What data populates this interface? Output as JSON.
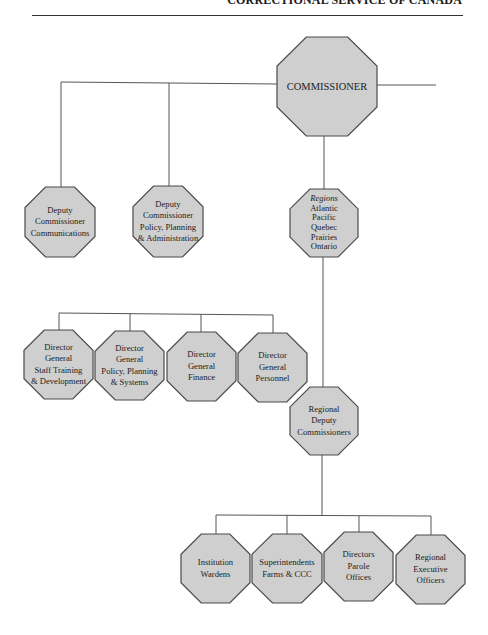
{
  "header": {
    "title": "CORRECTIONAL SERVICE OF CANADA"
  },
  "style": {
    "node_fill": "#cfcfcf",
    "node_stroke": "#4a4a4a",
    "line_color": "#555555"
  },
  "chart": {
    "commissioner": {
      "lines": [
        "COMMISSIONER"
      ]
    },
    "deputies": [
      {
        "lines": [
          "Deputy",
          "Commissioner",
          "Communications"
        ]
      },
      {
        "lines": [
          "Deputy",
          "Commissioner",
          "Policy, Planning",
          "& Administration"
        ]
      }
    ],
    "regions": {
      "heading": "Regions",
      "lines": [
        "Atlantic",
        "Pacific",
        "Quebec",
        "Prairies",
        "Ontario"
      ]
    },
    "directors_general": [
      {
        "lines": [
          "Director",
          "General",
          "Staff Training",
          "& Development"
        ]
      },
      {
        "lines": [
          "Director",
          "General",
          "Policy, Planning",
          "& Systems"
        ]
      },
      {
        "lines": [
          "Director",
          "General",
          "Finance"
        ]
      },
      {
        "lines": [
          "Director",
          "General",
          "Personnel"
        ]
      }
    ],
    "regional_deputy": {
      "lines": [
        "Regional",
        "Deputy",
        "Commissioners"
      ]
    },
    "regional_units": [
      {
        "lines": [
          "Institution",
          "Wardens"
        ]
      },
      {
        "lines": [
          "Superintendents",
          "Farms & CCC"
        ]
      },
      {
        "lines": [
          "Directors",
          "Parole",
          "Offices"
        ]
      },
      {
        "lines": [
          "Regional",
          "Executive",
          "Officers"
        ]
      }
    ]
  }
}
